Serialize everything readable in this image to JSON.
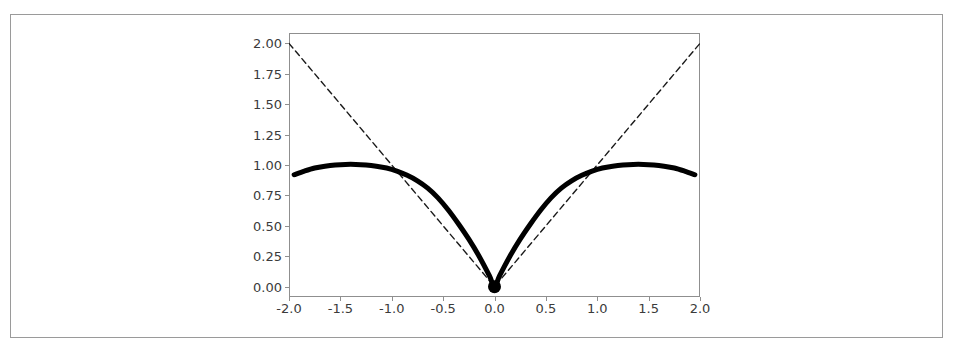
{
  "chart_data": {
    "type": "line",
    "title": "",
    "xlabel": "",
    "ylabel": "",
    "xlim": [
      -2.0,
      2.0
    ],
    "ylim": [
      -0.085,
      2.085
    ],
    "grid": false,
    "legend": "none",
    "background_color": "#ffffff",
    "line_color": "#000000",
    "frame_color": "#8f8f8f",
    "tick_label_color": "#3b3b3b",
    "xticks": [
      -2.0,
      -1.5,
      -1.0,
      -0.5,
      0.0,
      0.5,
      1.0,
      1.5,
      2.0
    ],
    "xtick_labels": [
      "-2.0",
      "-1.5",
      "-1.0",
      "-0.5",
      "0.0",
      "0.5",
      "1.0",
      "1.5",
      "2.0"
    ],
    "yticks": [
      0.0,
      0.25,
      0.5,
      0.75,
      1.0,
      1.25,
      1.5,
      1.75,
      2.0
    ],
    "ytick_labels": [
      "0.00",
      "0.25",
      "0.50",
      "0.75",
      "1.00",
      "1.25",
      "1.50",
      "1.75",
      "2.00"
    ],
    "series": [
      {
        "name": "absolute-value-reference",
        "style": "dashed",
        "color": "#1a1a1a",
        "linewidth": 1.4,
        "dash_pattern": "6,4",
        "x": [
          -2.0,
          -1.75,
          -1.5,
          -1.25,
          -1.0,
          -0.75,
          -0.5,
          -0.25,
          0.0,
          0.25,
          0.5,
          0.75,
          1.0,
          1.25,
          1.5,
          1.75,
          2.0
        ],
        "values": [
          2.0,
          1.75,
          1.5,
          1.25,
          1.0,
          0.75,
          0.5,
          0.25,
          0.0,
          0.25,
          0.5,
          0.75,
          1.0,
          1.25,
          1.5,
          1.75,
          2.0
        ]
      },
      {
        "name": "smoothed-absolute-value",
        "style": "solid",
        "color": "#000000",
        "linewidth": 5.0,
        "x": [
          -1.95,
          -1.85,
          -1.75,
          -1.65,
          -1.55,
          -1.45,
          -1.35,
          -1.25,
          -1.15,
          -1.05,
          -0.95,
          -0.85,
          -0.75,
          -0.65,
          -0.55,
          -0.45,
          -0.35,
          -0.25,
          -0.15,
          -0.05,
          0.0,
          0.05,
          0.15,
          0.25,
          0.35,
          0.45,
          0.55,
          0.65,
          0.75,
          0.85,
          0.95,
          1.05,
          1.15,
          1.25,
          1.35,
          1.45,
          1.55,
          1.65,
          1.75,
          1.85,
          1.95
        ],
        "values": [
          0.92,
          0.95,
          0.975,
          0.99,
          1.0,
          1.005,
          1.005,
          1.0,
          0.99,
          0.975,
          0.95,
          0.915,
          0.87,
          0.81,
          0.73,
          0.63,
          0.515,
          0.39,
          0.25,
          0.09,
          0.0,
          0.09,
          0.25,
          0.39,
          0.515,
          0.63,
          0.73,
          0.81,
          0.87,
          0.915,
          0.95,
          0.975,
          0.99,
          1.0,
          1.005,
          1.005,
          1.0,
          0.99,
          0.975,
          0.95,
          0.92
        ]
      }
    ],
    "markers": [
      {
        "name": "origin-marker",
        "x": 0.0,
        "y": 0.0,
        "shape": "circle",
        "color": "#000000",
        "size_px": 13
      }
    ]
  }
}
